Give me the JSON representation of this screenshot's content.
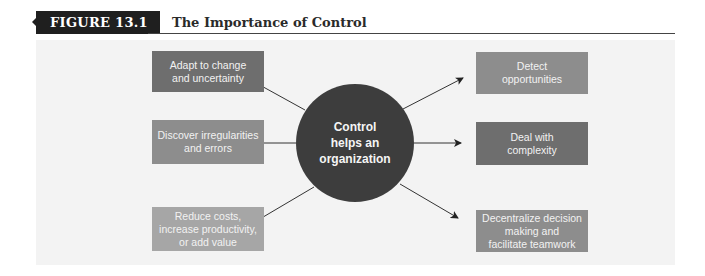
{
  "figure": {
    "label": "FIGURE 13.1",
    "title": "The Importance of Control"
  },
  "hub": {
    "lines": [
      "Control",
      "helps an",
      "organization"
    ]
  },
  "left_boxes": [
    {
      "lines": [
        "Adapt to change",
        "and uncertainty"
      ],
      "shade": "dark"
    },
    {
      "lines": [
        "Discover irregularities",
        "and errors"
      ],
      "shade": "mid"
    },
    {
      "lines": [
        "Reduce costs,",
        "increase productivity,",
        "or add value"
      ],
      "shade": "light"
    }
  ],
  "right_boxes": [
    {
      "lines": [
        "Detect",
        "opportunities"
      ],
      "shade": "mid"
    },
    {
      "lines": [
        "Deal with",
        "complexity"
      ],
      "shade": "dark"
    },
    {
      "lines": [
        "Decentralize decision",
        "making and",
        "facilitate teamwork"
      ],
      "shade": "mid"
    }
  ],
  "colors": {
    "dark": "#6e6e6e",
    "mid": "#8d8d8d",
    "light": "#a6a6a6",
    "hub": "#3d3d3d",
    "panel": "#f3f3f3",
    "label_bg": "#1f1f1f"
  }
}
